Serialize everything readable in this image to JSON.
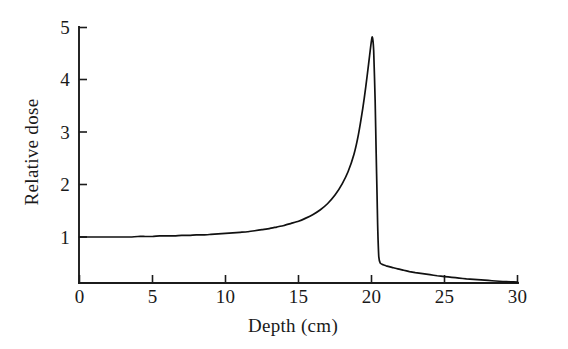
{
  "figure": {
    "background_color": "#ffffff",
    "line_color": "#111111",
    "axis_color": "#1b1b1b",
    "xlabel": "Depth (cm)",
    "ylabel": "Relative dose"
  },
  "chart_data": {
    "type": "line",
    "title": "",
    "subtitle": "",
    "xlabel": "Depth (cm)",
    "ylabel": "Relative dose",
    "xlim": [
      0,
      30
    ],
    "ylim": [
      0,
      5
    ],
    "xticks": [
      0,
      5,
      10,
      15,
      20,
      25,
      30
    ],
    "xticklabels": [
      "0",
      "5",
      "10",
      "15",
      "20",
      "25",
      "30"
    ],
    "yticks": [
      1,
      2,
      3,
      4,
      5
    ],
    "yticklabels": [
      "1",
      "2",
      "3",
      "4",
      "5"
    ],
    "grid": false,
    "legend": false,
    "legend_position": "none",
    "annotations": [],
    "series": [
      {
        "name": "Depth dose",
        "x": [
          0.0,
          0.5,
          1.0,
          1.5,
          2.0,
          2.5,
          3.0,
          3.5,
          4.0,
          4.5,
          5.0,
          5.5,
          6.0,
          6.5,
          7.0,
          7.5,
          8.0,
          8.5,
          9.0,
          9.5,
          10.0,
          10.5,
          11.0,
          11.5,
          12.0,
          12.5,
          13.0,
          13.5,
          14.0,
          14.5,
          15.0,
          15.5,
          16.0,
          16.5,
          17.0,
          17.5,
          18.0,
          18.4,
          18.8,
          19.1,
          19.4,
          19.6,
          19.8,
          19.95,
          20.05,
          20.15,
          20.25,
          20.32,
          20.38,
          20.42,
          20.45,
          20.5,
          20.6,
          20.8,
          21.0,
          21.4,
          21.8,
          22.2,
          22.6,
          23.0,
          23.5,
          24.0,
          24.5,
          25.0,
          25.5,
          26.0,
          26.5,
          27.0,
          27.5,
          28.0,
          28.5,
          29.0,
          29.5,
          30.0
        ],
        "y": [
          1.0,
          1.0,
          1.0,
          1.0,
          1.0,
          1.0,
          1.0,
          1.0,
          1.01,
          1.01,
          1.01,
          1.02,
          1.02,
          1.02,
          1.03,
          1.03,
          1.04,
          1.04,
          1.05,
          1.06,
          1.07,
          1.08,
          1.09,
          1.1,
          1.12,
          1.14,
          1.16,
          1.19,
          1.22,
          1.26,
          1.3,
          1.36,
          1.43,
          1.52,
          1.64,
          1.8,
          2.02,
          2.25,
          2.58,
          2.95,
          3.45,
          3.85,
          4.3,
          4.65,
          4.82,
          4.55,
          3.6,
          2.6,
          1.8,
          1.25,
          0.95,
          0.62,
          0.5,
          0.47,
          0.45,
          0.42,
          0.39,
          0.365,
          0.34,
          0.32,
          0.3,
          0.28,
          0.26,
          0.245,
          0.23,
          0.215,
          0.2,
          0.19,
          0.18,
          0.17,
          0.16,
          0.15,
          0.145,
          0.14
        ],
        "peak_x": 20.05,
        "peak_y": 4.82,
        "plateau_y": 1.0
      }
    ]
  }
}
